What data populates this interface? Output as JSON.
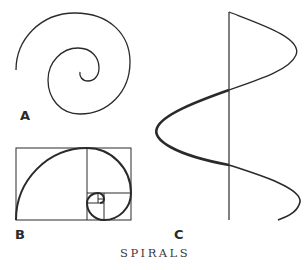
{
  "figure": {
    "title": "SPIRALS",
    "labels": {
      "a": "A",
      "b": "B",
      "c": "C"
    },
    "panels": [
      {
        "id": "A",
        "description": "Archimedean-like spiral curve"
      },
      {
        "id": "B",
        "description": "Golden rectangle with logarithmic (golden) spiral"
      },
      {
        "id": "C",
        "description": "Helix seen from the side with central axis"
      }
    ],
    "colors": {
      "stroke": "#2a2a2a",
      "background": "#ffffff"
    }
  }
}
